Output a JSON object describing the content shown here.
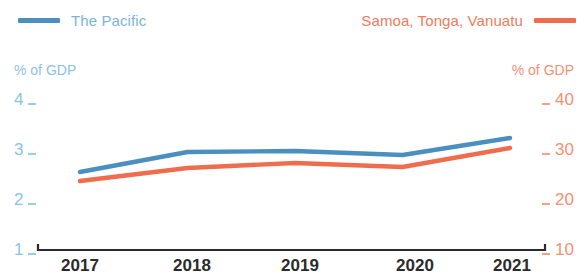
{
  "legend": {
    "left": {
      "label": "The Pacific",
      "color": "#4a8fc0",
      "swatch": "line-swatch-blue"
    },
    "right": {
      "label": "Samoa, Tonga, Vanuatu",
      "color": "#ef6c4d",
      "swatch": "line-swatch-orange"
    }
  },
  "axes": {
    "left_unit": "% of GDP",
    "right_unit": "% of GDP",
    "left_ticks": [
      "4",
      "3",
      "2",
      "1"
    ],
    "right_ticks": [
      "40",
      "30",
      "20",
      "10"
    ],
    "x_ticks": [
      "2017",
      "2018",
      "2019",
      "2020",
      "2021"
    ]
  },
  "chart_data": {
    "type": "line",
    "title": "",
    "subtitle": "",
    "xlabel": "",
    "ylabel": "% of GDP",
    "y2label": "% of GDP",
    "categories": [
      "2017",
      "2018",
      "2019",
      "2020",
      "2021"
    ],
    "x": [
      2017,
      2018,
      2019,
      2020,
      2021
    ],
    "ylim": [
      1,
      4
    ],
    "y2lim": [
      10,
      40
    ],
    "yticks": [
      1,
      2,
      3,
      4
    ],
    "y2ticks": [
      10,
      20,
      30,
      40
    ],
    "grid": false,
    "legend_position": "top",
    "series": [
      {
        "name": "The Pacific",
        "color": "#4a8fc0",
        "axis": "left",
        "values": [
          2.56,
          2.96,
          2.98,
          2.9,
          3.24
        ]
      },
      {
        "name": "Samoa, Tonga, Vanuatu",
        "color": "#ef6c4d",
        "axis": "right",
        "values": [
          23.8,
          26.4,
          27.4,
          26.6,
          30.4
        ]
      }
    ],
    "annotations": []
  },
  "geometry": {
    "plot_left": 80,
    "plot_right": 510,
    "y_for_1": 250,
    "y_for_4": 100,
    "axis_line_start": 38,
    "axis_line_end": 545,
    "axis_line_y": 250,
    "tick_rows": [
      100,
      150,
      200,
      250
    ]
  }
}
